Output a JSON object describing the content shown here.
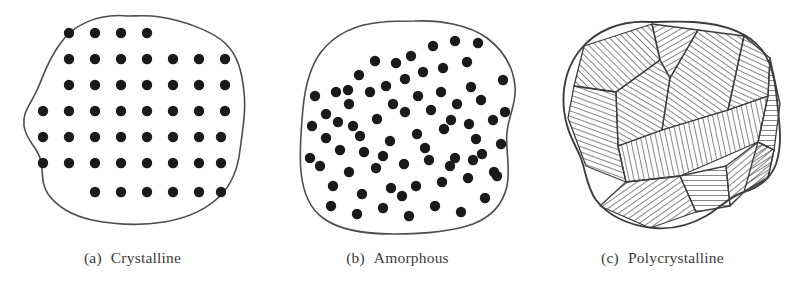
{
  "figure": {
    "background_color": "#ffffff",
    "outline_color": "#4d4d4d",
    "atom_color": "#1a1a1a",
    "hatch_color": "#2b2b2b",
    "caption_color": "#3b3b3b"
  },
  "panels": [
    {
      "id": "crystalline",
      "caption_index": "(a)",
      "caption_label": "Crystalline",
      "structure_type": "ordered-lattice",
      "atom_radius": 5.2,
      "atom_count": 48,
      "lattice": {
        "pitch_x": 26,
        "pitch_y": 26,
        "rows": [
          {
            "y": 33,
            "xs": [
              69,
              95,
              121,
              147
            ]
          },
          {
            "y": 59,
            "xs": [
              69,
              95,
              121,
              147,
              173,
              199,
              225
            ]
          },
          {
            "y": 85,
            "xs": [
              69,
              95,
              121,
              147,
              173,
              199,
              225
            ]
          },
          {
            "y": 111,
            "xs": [
              43,
              69,
              95,
              121,
              147,
              173,
              199,
              225
            ]
          },
          {
            "y": 137,
            "xs": [
              43,
              69,
              95,
              121,
              147,
              173,
              199,
              221
            ]
          },
          {
            "y": 163,
            "xs": [
              43,
              69,
              95,
              121,
              147,
              173,
              199,
              221
            ]
          },
          {
            "y": 192,
            "xs": [
              95,
              121,
              147,
              173,
              199,
              221
            ]
          }
        ]
      },
      "outline_path": "M 128 16 C 96 13 72 26 60 44 C 48 60 44 74 38 88 C 31 104 22 112 24 126 C 26 140 36 146 40 158 C 44 170 40 182 48 194 C 58 208 74 216 92 220 C 112 224 140 226 164 222 C 188 218 206 210 220 196 C 232 184 238 168 240 150 C 243 128 246 110 244 92 C 242 72 238 56 226 44 C 212 30 180 20 160 17 C 148 15 138 16 128 16 Z"
    },
    {
      "id": "amorphous",
      "caption_index": "(b)",
      "caption_label": "Amorphous",
      "structure_type": "disordered-random",
      "atom_radius": 5.2,
      "atom_count": 72,
      "atoms": [
        [
          71,
          92
        ],
        [
          61,
          114
        ],
        [
          94,
          75
        ],
        [
          84,
          104
        ],
        [
          110,
          61
        ],
        [
          121,
          86
        ],
        [
          146,
          56
        ],
        [
          140,
          79
        ],
        [
          168,
          46
        ],
        [
          178,
          68
        ],
        [
          190,
          41
        ],
        [
          202,
          62
        ],
        [
          213,
          43
        ],
        [
          206,
          87
        ],
        [
          61,
          138
        ],
        [
          88,
          126
        ],
        [
          75,
          150
        ],
        [
          99,
          152
        ],
        [
          112,
          119
        ],
        [
          125,
          141
        ],
        [
          140,
          112
        ],
        [
          152,
          134
        ],
        [
          166,
          110
        ],
        [
          179,
          129
        ],
        [
          192,
          104
        ],
        [
          204,
          124
        ],
        [
          216,
          100
        ],
        [
          228,
          120
        ],
        [
          55,
          166
        ],
        [
          68,
          186
        ],
        [
          84,
          172
        ],
        [
          97,
          194
        ],
        [
          111,
          168
        ],
        [
          126,
          188
        ],
        [
          139,
          164
        ],
        [
          151,
          186
        ],
        [
          164,
          160
        ],
        [
          177,
          182
        ],
        [
          190,
          158
        ],
        [
          203,
          178
        ],
        [
          217,
          154
        ],
        [
          229,
          172
        ],
        [
          66,
          206
        ],
        [
          92,
          214
        ],
        [
          118,
          208
        ],
        [
          144,
          216
        ],
        [
          170,
          206
        ],
        [
          196,
          212
        ],
        [
          220,
          198
        ],
        [
          238,
          80
        ],
        [
          240,
          112
        ],
        [
          236,
          144
        ],
        [
          232,
          176
        ],
        [
          47,
          126
        ],
        [
          45,
          158
        ],
        [
          50,
          96
        ],
        [
          128,
          104
        ],
        [
          153,
          96
        ],
        [
          176,
          92
        ],
        [
          105,
          92
        ],
        [
          83,
          90
        ],
        [
          131,
          63
        ],
        [
          158,
          72
        ],
        [
          186,
          120
        ],
        [
          211,
          139
        ],
        [
          118,
          156
        ],
        [
          95,
          136
        ],
        [
          73,
          122
        ],
        [
          160,
          148
        ],
        [
          185,
          166
        ],
        [
          208,
          160
        ],
        [
          137,
          196
        ]
      ],
      "outline_path": "M 118 22 C 92 24 70 34 56 52 C 44 68 40 88 38 108 C 36 130 34 152 36 172 C 38 192 44 208 58 218 C 74 230 100 234 128 234 C 156 234 186 232 208 224 C 226 217 238 204 242 186 C 246 166 240 150 242 132 C 244 114 252 102 250 86 C 248 66 238 50 222 38 C 204 25 176 20 150 21 C 138 21 128 21 118 22 Z"
    },
    {
      "id": "polycrystalline",
      "caption_index": "(c)",
      "caption_label": "Polycrystalline",
      "structure_type": "grains-with-boundaries",
      "grain_count": 12,
      "hatch_spacing": 5,
      "outline_path": "M 120 22 C 92 20 66 30 50 50 C 36 68 32 90 34 110 C 36 130 44 142 50 156 C 56 170 56 186 66 200 C 78 216 100 226 124 228 C 146 230 162 224 176 216 C 190 208 200 196 214 192 C 228 188 240 180 246 164 C 252 146 250 128 248 110 C 246 88 244 66 232 50 C 218 32 192 24 164 22 C 148 21 134 22 120 22 Z",
      "grains": [
        {
          "name": "grain-top-left",
          "angle": 135,
          "points": "54,46 122,24 130,60 86,92 44,86"
        },
        {
          "name": "grain-top-left-wedge",
          "angle": 60,
          "points": "122,24 168,30 140,78 130,60"
        },
        {
          "name": "grain-upper-mid",
          "angle": 120,
          "points": "130,60 140,78 132,130 88,146 86,92"
        },
        {
          "name": "grain-upper-center",
          "angle": 125,
          "points": "140,78 168,30 214,36 198,110 132,130"
        },
        {
          "name": "grain-upper-right",
          "angle": 115,
          "points": "214,36 240,58 238,96 198,110"
        },
        {
          "name": "grain-right-edge",
          "angle": 90,
          "points": "240,58 250,104 244,150 228,142 238,96"
        },
        {
          "name": "grain-left-mid",
          "angle": 110,
          "points": "44,86 86,92 88,146 96,182 56,166 38,118"
        },
        {
          "name": "grain-center-band",
          "angle": 168,
          "points": "88,146 132,130 198,110 238,96 228,142 150,176 96,182"
        },
        {
          "name": "grain-center-low",
          "angle": 55,
          "points": "96,182 150,176 166,212 120,228 70,206"
        },
        {
          "name": "grain-bottom-mid",
          "angle": 90,
          "points": "150,176 196,166 200,206 166,212"
        },
        {
          "name": "grain-bottom-right",
          "angle": 50,
          "points": "196,166 228,142 244,150 238,178 214,192 200,206"
        },
        {
          "name": "grain-right-low",
          "angle": 58,
          "points": "228,142 244,150 238,178 214,192"
        }
      ]
    }
  ]
}
